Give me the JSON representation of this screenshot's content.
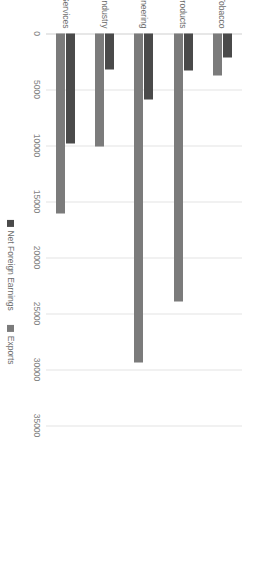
{
  "chart_data": {
    "type": "bar",
    "orientation": "vertical",
    "title": "",
    "subtitle": "",
    "xlabel": "",
    "ylabel": "",
    "grid": true,
    "legend_position": "bottom",
    "categories": [
      "Food, Beverages & Tobacco",
      "Chemical Products",
      "Metals & Engineering",
      "Other Industry",
      "Market Services"
    ],
    "series": [
      {
        "name": "Net Foreign Earnings",
        "color": "#4a4a4a",
        "values": [
          2100,
          3300,
          5900,
          3250,
          9800
        ]
      },
      {
        "name": "Exports",
        "color": "#7b7b7b",
        "values": [
          3750,
          23900,
          29400,
          10100,
          16100
        ]
      }
    ],
    "ylim": [
      0,
      35000
    ],
    "yticks": [
      0,
      5000,
      10000,
      15000,
      20000,
      25000,
      30000,
      35000
    ],
    "ytick_labels": [
      "0",
      "5000",
      "10000",
      "15000",
      "20000",
      "25000",
      "30000",
      "35000"
    ]
  },
  "legend": {
    "items": [
      {
        "label": "Net Foreign Earnings",
        "color": "#4a4a4a"
      },
      {
        "label": "Exports",
        "color": "#7b7b7b"
      }
    ]
  }
}
